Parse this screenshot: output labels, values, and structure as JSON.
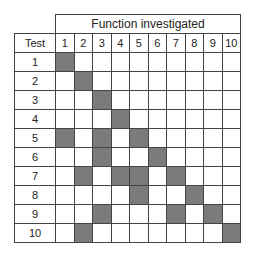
{
  "title": "Function investigated",
  "row_header": "Test",
  "columns": [
    "1",
    "2",
    "3",
    "4",
    "5",
    "6",
    "7",
    "8",
    "9",
    "10"
  ],
  "rows": [
    {
      "label": "1",
      "shaded": [
        1
      ]
    },
    {
      "label": "2",
      "shaded": [
        2
      ]
    },
    {
      "label": "3",
      "shaded": [
        3
      ]
    },
    {
      "label": "4",
      "shaded": [
        4
      ]
    },
    {
      "label": "5",
      "shaded": [
        1,
        3,
        5
      ]
    },
    {
      "label": "6",
      "shaded": [
        3,
        6
      ]
    },
    {
      "label": "7",
      "shaded": [
        2,
        4,
        5,
        7
      ]
    },
    {
      "label": "8",
      "shaded": [
        5,
        8
      ]
    },
    {
      "label": "9",
      "shaded": [
        3,
        7,
        9
      ]
    },
    {
      "label": "10",
      "shaded": [
        2,
        10
      ]
    }
  ],
  "colors": {
    "shaded": "#7b7b7b",
    "line": "#444444"
  }
}
